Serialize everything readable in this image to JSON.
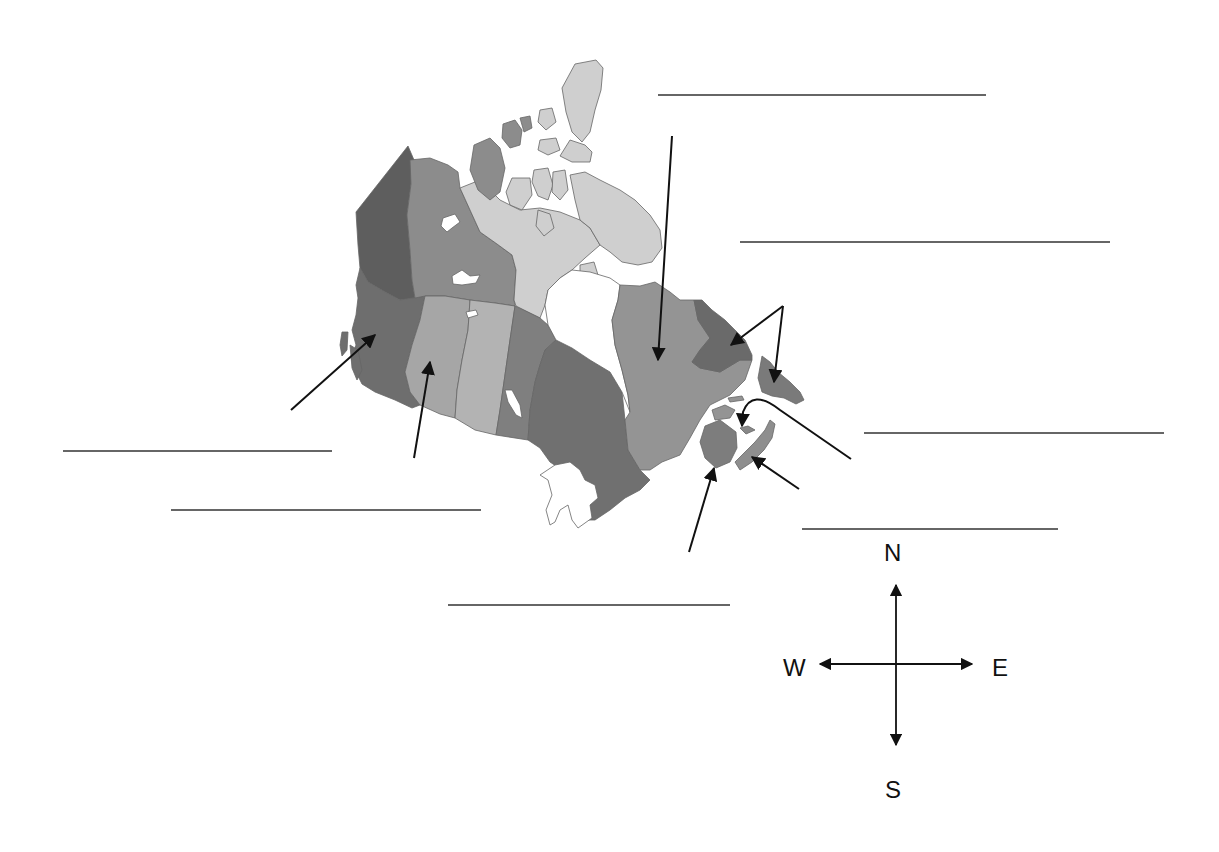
{
  "worksheet": {
    "subject": "Map of Canada - label the provinces and territories",
    "colors": {
      "background": "#ffffff",
      "ink": "#111111",
      "answer_line": "#333333",
      "water": "#ffffff",
      "coast": "#777777",
      "british_columbia": "#6e6e6e",
      "yukon": "#5e5e5e",
      "northwest_territories": "#8c8c8c",
      "nunavut": "#cfcfcf",
      "alberta": "#a6a6a6",
      "saskatchewan": "#b3b3b3",
      "manitoba": "#7f7f7f",
      "ontario": "#707070",
      "quebec": "#949494",
      "labrador": "#6a6a6a",
      "newfoundland": "#7a7a7a",
      "new_brunswick": "#7d7d7d",
      "nova_scotia": "#8e8e8e",
      "pei": "#888888"
    },
    "answer_blanks": [
      {
        "id": "blank-1",
        "x1": 658,
        "y": 95,
        "x2": 986,
        "value": ""
      },
      {
        "id": "blank-2",
        "x1": 740,
        "y": 242,
        "x2": 1110,
        "value": ""
      },
      {
        "id": "blank-3",
        "x1": 864,
        "y": 433,
        "x2": 1164,
        "value": ""
      },
      {
        "id": "blank-4",
        "x1": 63,
        "y": 451,
        "x2": 332,
        "value": ""
      },
      {
        "id": "blank-5",
        "x1": 171,
        "y": 510,
        "x2": 481,
        "value": ""
      },
      {
        "id": "blank-6",
        "x1": 802,
        "y": 529,
        "x2": 1058,
        "value": ""
      },
      {
        "id": "blank-7",
        "x1": 448,
        "y": 605,
        "x2": 730,
        "value": ""
      }
    ],
    "pointer_arrows": [
      {
        "id": "arrow-bc",
        "target": "British Columbia",
        "from": [
          291,
          410
        ],
        "to": [
          375,
          335
        ]
      },
      {
        "id": "arrow-alberta",
        "target": "Alberta",
        "from": [
          414,
          458
        ],
        "to": [
          430,
          362
        ]
      },
      {
        "id": "arrow-quebec",
        "target": "Quebec",
        "from": [
          672,
          136
        ],
        "to": [
          658,
          360
        ]
      },
      {
        "id": "arrow-labrador",
        "target": "Newfoundland and Labrador (Labrador)",
        "from": [
          783,
          306
        ],
        "to": [
          731,
          345
        ]
      },
      {
        "id": "arrow-newfoundland",
        "target": "Newfoundland and Labrador (Island)",
        "from": [
          783,
          306
        ],
        "to": [
          774,
          382
        ]
      },
      {
        "id": "arrow-pei",
        "target": "Prince Edward Island",
        "from": [
          851,
          459
        ],
        "to": [
          742,
          426
        ]
      },
      {
        "id": "arrow-nova-scotia",
        "target": "Nova Scotia",
        "from": [
          799,
          489
        ],
        "to": [
          752,
          457
        ]
      },
      {
        "id": "arrow-new-brunswick",
        "target": "New Brunswick",
        "from": [
          689,
          552
        ],
        "to": [
          714,
          468
        ]
      }
    ]
  },
  "compass": {
    "north": "N",
    "south": "S",
    "east": "E",
    "west": "W",
    "center": [
      896,
      664
    ]
  }
}
